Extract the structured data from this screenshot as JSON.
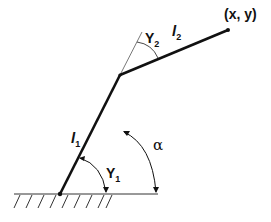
{
  "diagram": {
    "type": "two-link planar robot arm",
    "points": {
      "base": [
        60,
        194
      ],
      "elbow": [
        120,
        75
      ],
      "end_effector": [
        228,
        30
      ]
    },
    "labels": {
      "end_effector": "(x, y)",
      "link1": {
        "main": "l",
        "sub": "1"
      },
      "link2": {
        "main": "l",
        "sub": "2"
      },
      "gamma1": {
        "main": "Y",
        "sub": "1"
      },
      "gamma2": {
        "main": "Y",
        "sub": "2"
      },
      "alpha": "α"
    },
    "colors": {
      "stroke": "#111111",
      "background": "#ffffff"
    }
  }
}
